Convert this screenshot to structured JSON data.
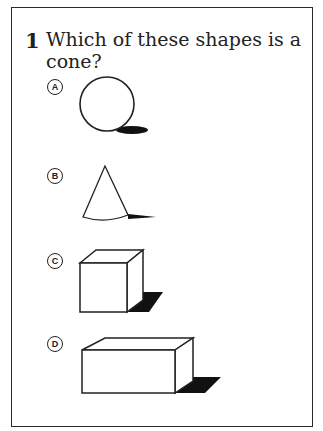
{
  "question": {
    "number": "1",
    "text": "Which of these shapes is a cone?"
  },
  "options": [
    {
      "letter": "A",
      "shape": "sphere"
    },
    {
      "letter": "B",
      "shape": "cone"
    },
    {
      "letter": "C",
      "shape": "cube"
    },
    {
      "letter": "D",
      "shape": "rectangular-prism"
    }
  ]
}
